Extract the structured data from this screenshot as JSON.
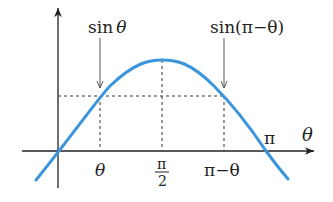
{
  "diagram": {
    "curve_color": "#3a95dc",
    "axis_color": "#222222",
    "labels": {
      "x_axis": "θ",
      "pi": "π",
      "theta": "θ",
      "half_pi_num": "π",
      "half_pi_den": "2",
      "pi_minus_theta": "π−θ",
      "sin_theta_prefix": "sin",
      "sin_theta_arg": "θ",
      "sin_pi_minus_theta": "sin(π−θ)"
    }
  }
}
